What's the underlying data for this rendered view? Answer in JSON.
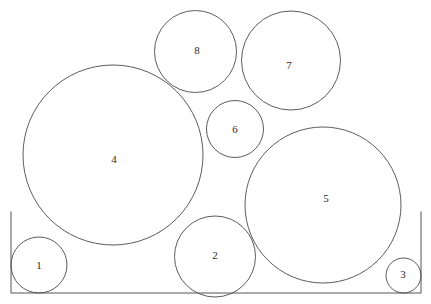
{
  "figure": {
    "kind": "circle-packing-diagram",
    "background_color": "#ffffff",
    "stroke_color": "#4a4a4a",
    "container_stroke_color": "#555555",
    "label_color": "#2b2b2b",
    "width": 431,
    "height": 304
  },
  "container": {
    "name": "open-top-box",
    "left_x": 11,
    "right_x": 421,
    "top_y": 212,
    "bottom_y": 293,
    "path": "M 11 212 L 11 293 L 421 293 L 421 212"
  },
  "circles": [
    {
      "label": "1",
      "cx": 39,
      "cy": 265,
      "r": 28,
      "label_x": 39,
      "label_y": 266
    },
    {
      "label": "2",
      "cx": 215,
      "cy": 256.5,
      "r": 40.5,
      "label_x": 215,
      "label_y": 256
    },
    {
      "label": "3",
      "cx": 403.5,
      "cy": 275.5,
      "r": 17.5,
      "label_x": 403,
      "label_y": 275
    },
    {
      "label": "4",
      "cx": 113,
      "cy": 155,
      "r": 90,
      "label_x": 114,
      "label_y": 160
    },
    {
      "label": "5",
      "cx": 323,
      "cy": 205,
      "r": 78,
      "label_x": 326,
      "label_y": 199
    },
    {
      "label": "6",
      "cx": 235,
      "cy": 129,
      "r": 28.5,
      "label_x": 235,
      "label_y": 130
    },
    {
      "label": "7",
      "cx": 291,
      "cy": 60.5,
      "r": 49.5,
      "label_x": 289,
      "label_y": 66
    },
    {
      "label": "8",
      "cx": 195.5,
      "cy": 51.5,
      "r": 41,
      "label_x": 197,
      "label_y": 51
    }
  ]
}
